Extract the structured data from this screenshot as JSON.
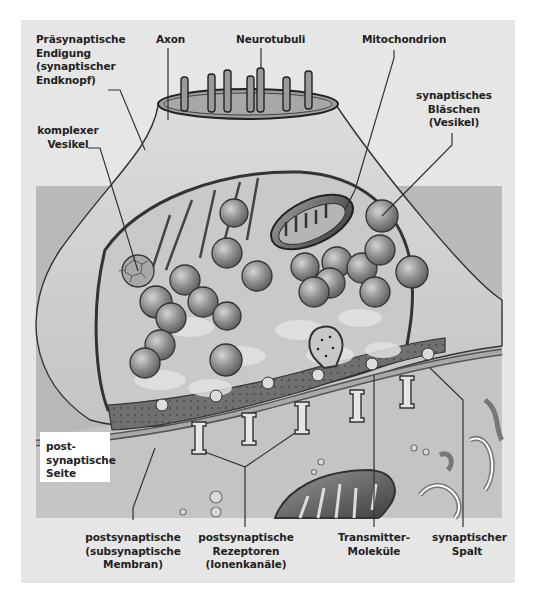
{
  "diagram": {
    "colors": {
      "panel": "#e6e6e6",
      "inner_background": "#b8b8b8",
      "terminal": "#d6d6d6",
      "cytoplasm": "#c8c8c8",
      "vesicle": "#8f8f8f",
      "cleft": "#6f6f6f",
      "outline": "#333333"
    },
    "labels": {
      "presynaptic": {
        "line1": "Präsynaptische",
        "line2": "Endigung",
        "line3": "(synaptischer",
        "line4": "Endknopf)"
      },
      "axon": {
        "line1": "Axon"
      },
      "neurotubuli": {
        "line1": "Neurotubuli"
      },
      "mitochondrion": {
        "line1": "Mitochondrion"
      },
      "synaptic_vesicle": {
        "line1": "synaptisches",
        "line2": "Bläschen",
        "line3": "(Vesikel)"
      },
      "complex_vesicle": {
        "line1": "komplexer",
        "line2": "Vesikel"
      },
      "postsynaptic_side": {
        "line1": "post-",
        "line2": "synaptische",
        "line3": "Seite"
      },
      "postsynaptic_membrane": {
        "line1": "postsynaptische",
        "line2": "(subsynaptische",
        "line3": "Membran)"
      },
      "postsynaptic_receptors": {
        "line1": "postsynaptische",
        "line2": "Rezeptoren",
        "line3": "(Ionenkanäle)"
      },
      "transmitter": {
        "line1": "Transmitter-",
        "line2": "Moleküle"
      },
      "synaptic_cleft": {
        "line1": "synaptischer",
        "line2": "Spalt"
      }
    }
  }
}
